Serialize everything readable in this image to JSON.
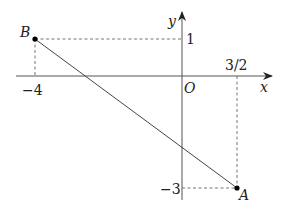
{
  "diagram": {
    "type": "coordinate-plane",
    "axes": {
      "x_label": "x",
      "y_label": "y",
      "origin_label": "O"
    },
    "points": {
      "A": {
        "label": "A",
        "x": 1.5,
        "y": -3
      },
      "B": {
        "label": "B",
        "x": -4,
        "y": 1
      }
    },
    "ticks": {
      "x_neg4": "−4",
      "x_3_2": "3/2",
      "y_1": "1",
      "y_neg3": "−3"
    },
    "segment": "AB",
    "colors": {
      "axis": "#555555",
      "line": "#444444",
      "dashed": "#666666",
      "point": "#000000"
    }
  }
}
